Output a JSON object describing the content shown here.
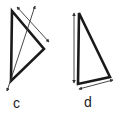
{
  "figures": [
    {
      "id": "c",
      "label": "c",
      "shape": "triangle",
      "vertices": [
        [
          12,
          11
        ],
        [
          44,
          49
        ],
        [
          11,
          81
        ]
      ],
      "arrows": [
        {
          "from": [
            17,
            7
          ],
          "to": [
            49,
            42
          ],
          "type": "double-headed",
          "note": "parallel to top-right edge"
        },
        {
          "from": [
            35,
            6
          ],
          "to": [
            7,
            91
          ],
          "type": "double-headed",
          "note": "diagonal crossing triangle"
        }
      ]
    },
    {
      "id": "d",
      "label": "d",
      "shape": "triangle",
      "vertices": [
        [
          79,
          13
        ],
        [
          78,
          84
        ],
        [
          110,
          77
        ]
      ],
      "arrows": [
        {
          "from": [
            74,
            13
          ],
          "to": [
            74,
            83
          ],
          "type": "double-headed",
          "note": "parallel to left edge"
        },
        {
          "from": [
            79,
            89
          ],
          "to": [
            113,
            80
          ],
          "type": "double-headed",
          "note": "parallel to bottom edge"
        }
      ]
    }
  ],
  "colors": {
    "stroke": "#1a1a1a",
    "arrow": "#333333",
    "background": "#ffffff"
  }
}
